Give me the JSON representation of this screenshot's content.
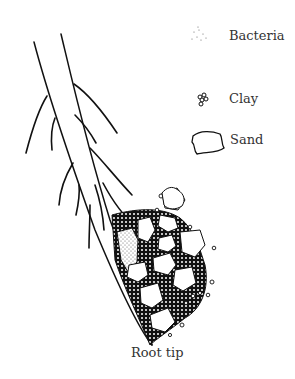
{
  "legend": {
    "items": [
      {
        "key": "bacteria",
        "label": "Bacteria",
        "icon": "dots-icon"
      },
      {
        "key": "clay",
        "label": "Clay",
        "icon": "clay-cluster-icon"
      },
      {
        "key": "sand",
        "label": "Sand",
        "icon": "sand-grain-icon"
      }
    ]
  },
  "caption": "Root tip",
  "colors": {
    "ink": "#111111",
    "text": "#333333",
    "background": "#ffffff"
  }
}
